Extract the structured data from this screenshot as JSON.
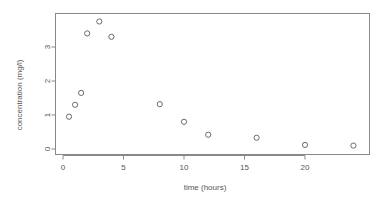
{
  "chart_data": {
    "type": "scatter",
    "title": "",
    "xlabel": "time (hours)",
    "ylabel": "concentration (mg/l)",
    "xlim": [
      -0.6,
      25.4
    ],
    "ylim": [
      -0.12,
      3.95
    ],
    "xticks": [
      0,
      5,
      10,
      15,
      20
    ],
    "xtick_labels": [
      "0",
      "5",
      "10",
      "15",
      "20"
    ],
    "yticks": [
      0,
      1,
      2,
      3
    ],
    "ytick_labels": [
      "0",
      "1",
      "2",
      "3"
    ],
    "grid": false,
    "legend": null,
    "marker": "open-circle",
    "marker_color": "#6b6b6b",
    "axis_color": "#888888",
    "text_color": "#555555",
    "background": "#ffffff",
    "x": [
      0.5,
      1,
      1.5,
      2,
      3,
      4,
      8,
      10,
      12,
      16,
      20,
      24
    ],
    "y": [
      0.95,
      1.3,
      1.65,
      3.4,
      3.75,
      3.3,
      1.32,
      0.8,
      0.42,
      0.33,
      0.12,
      0.1
    ],
    "points": [
      {
        "x": 0.5,
        "y": 0.95
      },
      {
        "x": 1,
        "y": 1.3
      },
      {
        "x": 1.5,
        "y": 1.65
      },
      {
        "x": 2,
        "y": 3.4
      },
      {
        "x": 3,
        "y": 3.75
      },
      {
        "x": 4,
        "y": 3.3
      },
      {
        "x": 8,
        "y": 1.32
      },
      {
        "x": 10,
        "y": 0.8
      },
      {
        "x": 12,
        "y": 0.42
      },
      {
        "x": 16,
        "y": 0.33
      },
      {
        "x": 20,
        "y": 0.12
      },
      {
        "x": 24,
        "y": 0.1
      }
    ]
  },
  "labels": {
    "xlabel": "time (hours)",
    "ylabel": "concentration (mg/l)"
  }
}
